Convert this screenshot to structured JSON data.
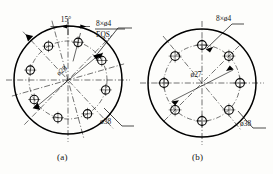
{
  "drawing": {
    "type": "engineering-drawing",
    "sheet_width": 273,
    "sheet_height": 174,
    "background_color": "#fdfdfb",
    "line_color": "#000000"
  },
  "figures": [
    {
      "id": "a",
      "caption": "(a)",
      "center": {
        "x": 68,
        "y": 80
      },
      "outer_circle": {
        "diameter_label": "ø38",
        "radius_px": 54
      },
      "bolt_circle": {
        "diameter_label": "ø28",
        "radius_px": 39
      },
      "holes": {
        "count": 8,
        "label": "8×ø4",
        "note": "EQS",
        "diameter_px": 8,
        "start_angle_deg": 15,
        "spacing_deg": 45
      },
      "angle_dimension": {
        "value": "15",
        "unit": "°",
        "text": "15°"
      },
      "labels": {
        "holes": "8×ø4",
        "holes_note": "EQS",
        "bolt_circle": "ø28",
        "outer": "ø38",
        "angle": "15°"
      }
    },
    {
      "id": "b",
      "caption": "(b)",
      "center": {
        "x": 202,
        "y": 83
      },
      "outer_circle": {
        "diameter_label": "ø38",
        "radius_px": 54
      },
      "bolt_circle": {
        "diameter_label": "ø27",
        "radius_px": 38
      },
      "holes": {
        "count": 8,
        "label": "8×ø4",
        "note": "",
        "diameter_px": 8,
        "start_angle_deg": 0,
        "spacing_deg": 45
      },
      "labels": {
        "holes": "8×ø4",
        "bolt_circle": "ø27",
        "outer": "ø38"
      }
    }
  ],
  "text": {
    "fig_a_holes": "8×ø4",
    "fig_a_eqs": "EQS",
    "fig_a_bolt": "ø28",
    "fig_a_outer": "ø38",
    "fig_a_angle": "15°",
    "fig_a_caption": "(a)",
    "fig_b_holes": "8×ø4",
    "fig_b_bolt": "ø27",
    "fig_b_outer": "ø38",
    "fig_b_caption": "(b)"
  }
}
